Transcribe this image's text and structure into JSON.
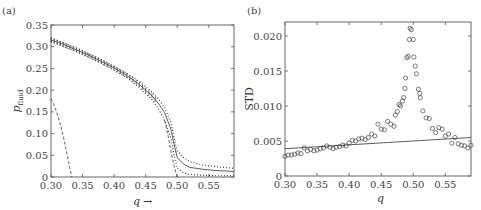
{
  "chart_data": [
    {
      "panel": "(a)",
      "type": "line",
      "title": "",
      "xlabel": "q →",
      "ylabel": "p_fluid",
      "xlim": [
        0.3,
        0.59
      ],
      "ylim": [
        0,
        0.35
      ],
      "xticks": [
        "0.30",
        "0.35",
        "0.40",
        "0.45",
        "0.50",
        "0.55"
      ],
      "yticks": [
        "0",
        "0.05",
        "0.10",
        "0.15",
        "0.20",
        "0.25",
        "0.30",
        "0.35"
      ],
      "grid": false,
      "series": [
        {
          "name": "mean (solid with error bars)",
          "style": "solid",
          "x": [
            0.3,
            0.32,
            0.34,
            0.36,
            0.38,
            0.4,
            0.42,
            0.44,
            0.46,
            0.47,
            0.48,
            0.49,
            0.495,
            0.5,
            0.51,
            0.52,
            0.54,
            0.56,
            0.59
          ],
          "y": [
            0.316,
            0.305,
            0.293,
            0.28,
            0.266,
            0.251,
            0.234,
            0.213,
            0.187,
            0.17,
            0.148,
            0.11,
            0.075,
            0.045,
            0.03,
            0.022,
            0.018,
            0.015,
            0.013
          ]
        },
        {
          "name": "upper bound (dotted)",
          "style": "dotted",
          "x": [
            0.3,
            0.34,
            0.38,
            0.42,
            0.44,
            0.46,
            0.47,
            0.48,
            0.49,
            0.495,
            0.5,
            0.51,
            0.52,
            0.54,
            0.56,
            0.59
          ],
          "y": [
            0.32,
            0.297,
            0.27,
            0.239,
            0.22,
            0.195,
            0.18,
            0.16,
            0.125,
            0.09,
            0.06,
            0.045,
            0.035,
            0.028,
            0.024,
            0.02
          ]
        },
        {
          "name": "lower bound (dotted)",
          "style": "dotted",
          "x": [
            0.3,
            0.34,
            0.38,
            0.42,
            0.44,
            0.46,
            0.47,
            0.48,
            0.49,
            0.495,
            0.5,
            0.51,
            0.52,
            0.54,
            0.56,
            0.59
          ],
          "y": [
            0.312,
            0.289,
            0.262,
            0.229,
            0.206,
            0.178,
            0.158,
            0.13,
            0.09,
            0.05,
            0.02,
            0.01,
            0.006,
            0.004,
            0.003,
            0.003
          ]
        },
        {
          "name": "mean-field (dashed)",
          "style": "dashed",
          "x": [
            0.3,
            0.305,
            0.31,
            0.315,
            0.32,
            0.325,
            0.33,
            0.333
          ],
          "y": [
            0.18,
            0.165,
            0.145,
            0.12,
            0.09,
            0.055,
            0.02,
            0.0
          ]
        },
        {
          "name": "lower dashed near transition",
          "style": "dashed",
          "x": [
            0.48,
            0.485,
            0.49,
            0.495,
            0.5
          ],
          "y": [
            0.13,
            0.1,
            0.06,
            0.025,
            0.0
          ]
        }
      ]
    },
    {
      "panel": "(b)",
      "type": "scatter",
      "title": "",
      "xlabel": "q",
      "ylabel": "STD",
      "xlim": [
        0.3,
        0.59
      ],
      "ylim": [
        0,
        0.022
      ],
      "xticks": [
        "0.30",
        "0.35",
        "0.40",
        "0.45",
        "0.50",
        "0.55"
      ],
      "yticks": [
        "0",
        "0.005",
        "0.010",
        "0.015",
        "0.020"
      ],
      "grid": false,
      "series": [
        {
          "name": "STD (open circles)",
          "marker": "o",
          "x": [
            0.3,
            0.305,
            0.31,
            0.315,
            0.32,
            0.325,
            0.33,
            0.335,
            0.34,
            0.345,
            0.35,
            0.355,
            0.36,
            0.365,
            0.37,
            0.375,
            0.38,
            0.385,
            0.39,
            0.395,
            0.4,
            0.405,
            0.41,
            0.415,
            0.42,
            0.425,
            0.43,
            0.435,
            0.44,
            0.445,
            0.45,
            0.455,
            0.46,
            0.465,
            0.47,
            0.472,
            0.475,
            0.478,
            0.48,
            0.483,
            0.485,
            0.487,
            0.488,
            0.49,
            0.492,
            0.494,
            0.495,
            0.497,
            0.5,
            0.501,
            0.503,
            0.505,
            0.508,
            0.51,
            0.511,
            0.515,
            0.52,
            0.525,
            0.53,
            0.535,
            0.54,
            0.545,
            0.55,
            0.555,
            0.56,
            0.565,
            0.57,
            0.575,
            0.58,
            0.585,
            0.59
          ],
          "y": [
            0.0028,
            0.003,
            0.003,
            0.0031,
            0.0033,
            0.0032,
            0.004,
            0.0036,
            0.0038,
            0.0036,
            0.0037,
            0.0039,
            0.004,
            0.0043,
            0.0041,
            0.0039,
            0.0041,
            0.0042,
            0.0044,
            0.0043,
            0.0047,
            0.0051,
            0.005,
            0.0053,
            0.0054,
            0.0052,
            0.0055,
            0.006,
            0.0057,
            0.0074,
            0.0067,
            0.0066,
            0.0078,
            0.0074,
            0.0071,
            0.0087,
            0.0092,
            0.0102,
            0.01,
            0.0107,
            0.0112,
            0.0125,
            0.014,
            0.0169,
            0.0171,
            0.0195,
            0.0211,
            0.0209,
            0.0195,
            0.017,
            0.0157,
            0.0146,
            0.0124,
            0.0118,
            0.0112,
            0.0093,
            0.0083,
            0.0082,
            0.0068,
            0.0062,
            0.0069,
            0.0067,
            0.0057,
            0.006,
            0.0047,
            0.0055,
            0.0046,
            0.0044,
            0.0043,
            0.004,
            0.0044
          ]
        },
        {
          "name": "reference line (solid)",
          "style": "solid",
          "x": [
            0.3,
            0.59
          ],
          "y": [
            0.0039,
            0.0055
          ]
        }
      ]
    }
  ],
  "panels": {
    "a": {
      "label": "(a)",
      "xlabel_q": "q",
      "xlabel_arrow": "→",
      "ylabel_main": "p",
      "ylabel_sub": "fluid"
    },
    "b": {
      "label": "(b)",
      "xlabel": "q",
      "ylabel": "STD"
    }
  }
}
